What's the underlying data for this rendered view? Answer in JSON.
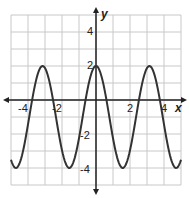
{
  "chart_data": {
    "type": "line",
    "title": "",
    "xlabel": "x",
    "ylabel": "y",
    "xlim": [
      -5,
      5
    ],
    "ylim": [
      -5,
      5
    ],
    "grid": true,
    "x_ticks": [
      -4,
      -2,
      2,
      4
    ],
    "y_ticks": [
      4,
      2,
      -2,
      -4
    ],
    "series": [
      {
        "name": "y = 3cos(2x) - 1",
        "x": [
          -5,
          -4.71,
          -4.5,
          -4,
          -3.5,
          -3.14,
          -3,
          -2.5,
          -2,
          -1.57,
          -1.5,
          -1,
          -0.5,
          0,
          0.5,
          1,
          1.5,
          1.57,
          2,
          2.5,
          3,
          3.14,
          3.5,
          4,
          4.5,
          4.71,
          5
        ],
        "y": [
          -3.52,
          -4,
          -3.73,
          -1.44,
          1.26,
          2,
          1.88,
          -0.14,
          -2.96,
          -4,
          -3.97,
          -2.25,
          0.62,
          2,
          0.62,
          -2.25,
          -3.97,
          -4,
          -2.96,
          -0.14,
          1.88,
          2,
          1.26,
          -1.44,
          -3.73,
          -4,
          -3.52
        ],
        "color": "#333333",
        "max": 2,
        "min": -4,
        "period": 3.14
      }
    ]
  },
  "labels": {
    "x_axis": "x",
    "y_axis": "y",
    "x_ticks": [
      "-4",
      "-2",
      "2",
      "4"
    ],
    "y_ticks": [
      "4",
      "2",
      "-2",
      "-4"
    ]
  }
}
